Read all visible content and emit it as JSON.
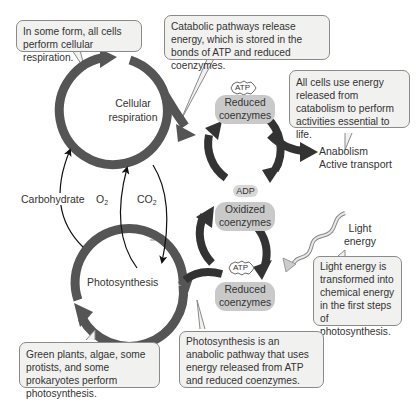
{
  "callouts": {
    "respiration_all_cells": "In some form, all cells perform cellular respiration.",
    "catabolic": "Catabolic pathways release energy, which is stored in the bonds of ATP and reduced coenzymes.",
    "use_energy": "All cells use energy released from catabolism to perform activities essential to life.",
    "light_transform": "Light energy is transformed into chemical energy in the first steps of photosynthesis.",
    "green_plants": "Green plants, algae, some protists, and some prokaryotes perform photosynthesis.",
    "anabolic": "Photosynthesis is an anabolic pathway that uses energy released from ATP and reduced coenzymes."
  },
  "cycles": {
    "respiration_line1": "Cellular",
    "respiration_line2": "respiration",
    "photosynthesis": "Photosynthesis"
  },
  "labels": {
    "carbohydrate": "Carbohydrate",
    "o2_main": "O",
    "o2_sub": "2",
    "co2_main": "CO",
    "co2_sub": "2",
    "anabolism": "Anabolism",
    "active_transport": "Active transport",
    "light_line1": "Light",
    "light_line2": "energy",
    "adp": "ADP"
  },
  "molecules": {
    "atp_top": "ATP",
    "reduced_top_1": "Reduced",
    "reduced_top_2": "coenzymes",
    "oxidized_1": "Oxidized",
    "oxidized_2": "coenzymes",
    "atp_bottom": "ATP",
    "reduced_bottom_1": "Reduced",
    "reduced_bottom_2": "coenzymes"
  },
  "colors": {
    "cycle_arrow": "#555555",
    "callout_bg": "#f1f1ef",
    "pill_bg": "#c9c9c9",
    "light_wave": "#b5b5b5"
  }
}
